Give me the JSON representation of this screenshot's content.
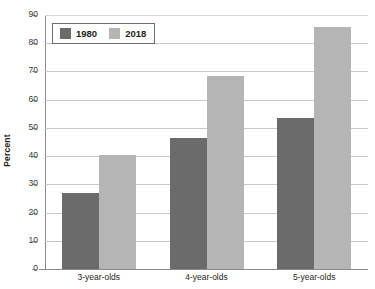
{
  "chart_data": {
    "type": "bar",
    "title": "",
    "subtitle": "",
    "xlabel": "",
    "ylabel": "Percent",
    "categories": [
      "3-year-olds",
      "4-year-olds",
      "5-year-olds"
    ],
    "series": [
      {
        "name": "1980",
        "color": "#6b6b6b",
        "values": [
          27.0,
          46.3,
          53.6
        ]
      },
      {
        "name": "2018",
        "color": "#b5b5b5",
        "values": [
          40.4,
          68.5,
          85.6
        ]
      }
    ],
    "ylim": [
      0,
      90
    ],
    "ytick_step": 10,
    "ytick_labels": [
      "0",
      "10",
      "20",
      "30",
      "40",
      "50",
      "60",
      "70",
      "80",
      "90"
    ],
    "grid": true,
    "grid_axis": "y",
    "legend_position": "upper left inside plot",
    "legend_entries": [
      "1980",
      "2018"
    ],
    "annotations": []
  },
  "colors": {
    "series_1980": "#6b6b6b",
    "series_2018": "#b5b5b5",
    "gridline": "#c9c9c9",
    "axis": "#8a8a8a",
    "text": "#231f20",
    "background": "#ffffff"
  }
}
